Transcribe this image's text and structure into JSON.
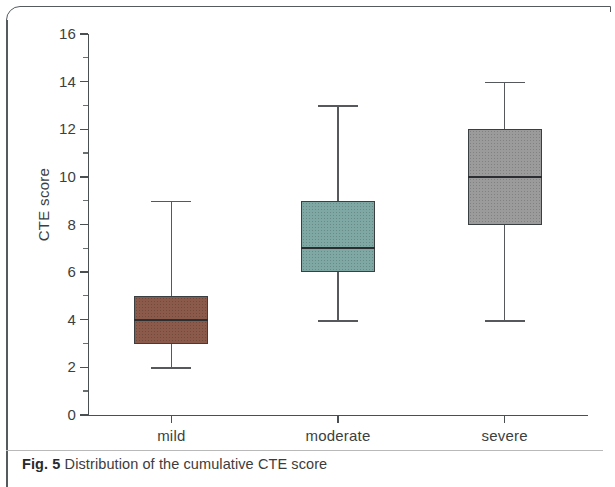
{
  "figure": {
    "caption_label": "Fig. 5",
    "caption_text": " Distribution of the cumulative CTE score"
  },
  "chart_data": {
    "type": "box",
    "title": "",
    "xlabel": "",
    "ylabel": "CTE score",
    "ylim": [
      0,
      16
    ],
    "ytick_step": 2,
    "yminor_step": 1,
    "grid": false,
    "legend": "none",
    "categories": [
      "mild",
      "moderate",
      "severe"
    ],
    "ytick_labels": [
      "0",
      "2",
      "4",
      "6",
      "8",
      "10",
      "12",
      "14",
      "16"
    ],
    "boxes": [
      {
        "category": "mild",
        "whisker_low": 2,
        "q1": 3,
        "median": 4,
        "q3": 5,
        "whisker_high": 9,
        "color": "#8b5a4a"
      },
      {
        "category": "moderate",
        "whisker_low": 4,
        "q1": 6,
        "median": 7,
        "q3": 9,
        "whisker_high": 13,
        "color": "#7fa8a4"
      },
      {
        "category": "severe",
        "whisker_low": 4,
        "q1": 8,
        "median": 10,
        "q3": 12,
        "whisker_high": 14,
        "color": "#9b9b9b"
      }
    ]
  }
}
